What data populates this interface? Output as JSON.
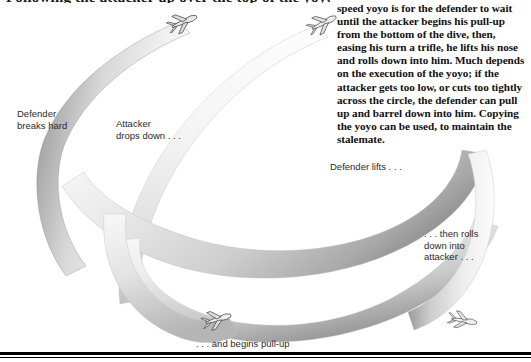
{
  "page": {
    "heading_partial": "Following the attacker up over the top of the yoyo",
    "background_color": "#ffffff",
    "rule_color": "#000000"
  },
  "illustration": {
    "name": "high-speed-yoyo-maneuver-diagram",
    "ribbon_light": "#f2f2f2",
    "ribbon_mid": "#bdbdbd",
    "ribbon_dark": "#6e6e6e",
    "aircraft_color": "#4a4a4a",
    "aircraft": [
      {
        "id": "attacker-top-left",
        "label": "attacker aircraft entering dive"
      },
      {
        "id": "defender-top-right",
        "label": "defender aircraft entering dive"
      },
      {
        "id": "aircraft-bottom-pullup",
        "label": "aircraft at bottom beginning pull-up"
      },
      {
        "id": "aircraft-bottom-right",
        "label": "aircraft rolling down into attacker"
      }
    ]
  },
  "labels": {
    "defender_breaks": "Defender\nbreaks hard",
    "attacker_drops": "Attacker\ndrops down . . .",
    "defender_lifts": "Defender lifts . . .",
    "then_rolls": ". . . then rolls\ndown into\nattacker . . .",
    "begins_pullup": ". . . and begins pull-up"
  },
  "body_text": {
    "paragraph": "speed yoyo is for the defender to wait until the attacker begins his pull-up from the bottom of the dive, then, easing his turn a trifle, he lifts his nose and rolls down into him. Much depends on the execution of the yoyo; if the attacker gets too low, or cuts too tightly across the circle, the defender can pull up and barrel down into him. Copying the yoyo can be used, to maintain the stalemate."
  }
}
